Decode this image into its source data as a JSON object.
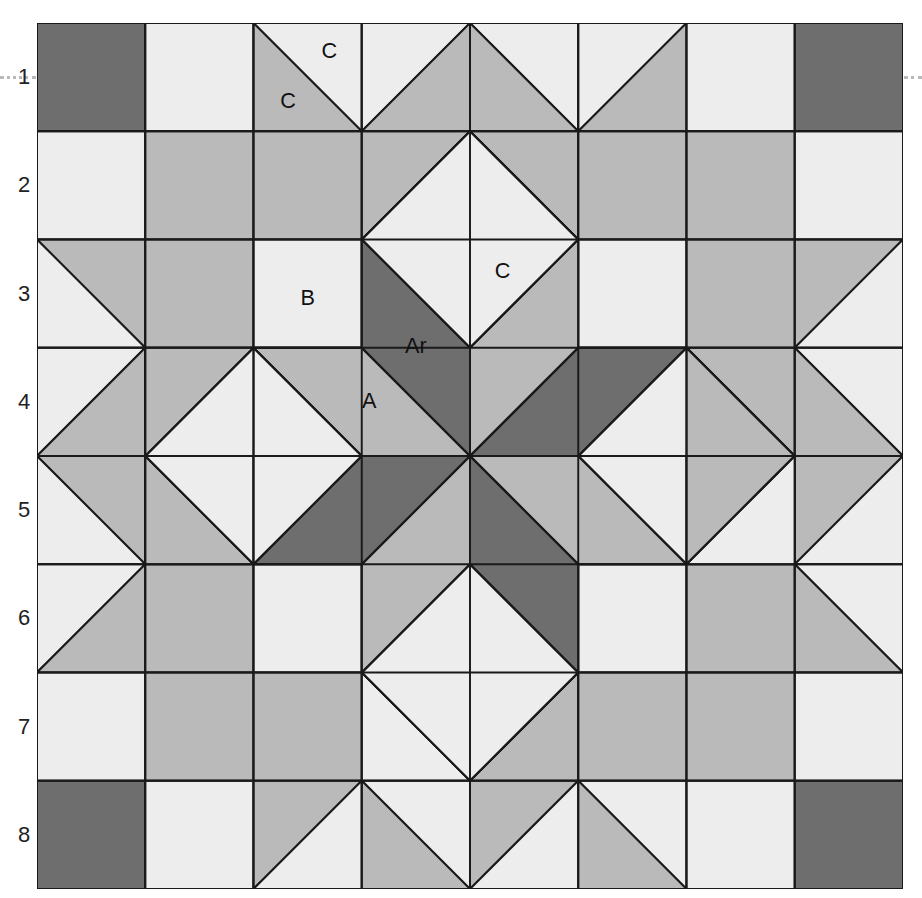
{
  "grid": {
    "rows": 8,
    "cols": 8
  },
  "row_labels": [
    "1",
    "2",
    "3",
    "4",
    "5",
    "6",
    "7",
    "8"
  ],
  "piece_labels": [
    {
      "text": "C",
      "col": 2.7,
      "row": 0.27
    },
    {
      "text": "C",
      "col": 2.32,
      "row": 0.73
    },
    {
      "text": "B",
      "col": 2.5,
      "row": 2.55
    },
    {
      "text": "C",
      "col": 4.3,
      "row": 2.3
    },
    {
      "text": "Ar",
      "col": 3.5,
      "row": 3.0
    },
    {
      "text": "A",
      "col": 3.07,
      "row": 3.5
    }
  ],
  "colors": {
    "dark": "#6e6e6e",
    "medium": "#bababa",
    "light": "#ededed",
    "line": "#1a1a1a"
  },
  "legend": {
    "A": "star diamond (light print)",
    "Ar": "star diamond reversed (dark)",
    "B": "background square",
    "C": "half-square triangle"
  }
}
